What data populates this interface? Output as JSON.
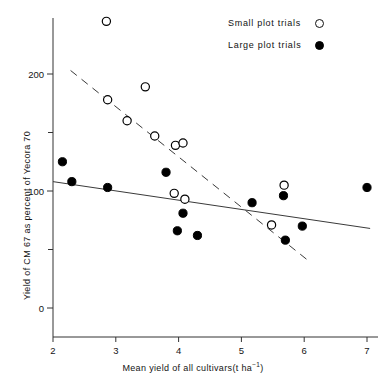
{
  "chart_data": {
    "type": "scatter",
    "title": "",
    "xlabel": "Mean yield of all cultivars (t ha⁻¹)",
    "ylabel": "Yield of CM 67 as percent of Yecora 70",
    "xlim": [
      2,
      7
    ],
    "ylim": [
      0,
      260
    ],
    "grid": false,
    "legend_position": "top-right",
    "xticks": [
      2,
      3,
      4,
      5,
      6,
      7
    ],
    "xtick_labels": [
      "2",
      "3",
      "4",
      "5",
      "6",
      "7"
    ],
    "yticks": [
      0,
      50,
      100,
      150,
      200
    ],
    "ytick_labels": [
      "0",
      "",
      "100",
      "",
      "200"
    ],
    "ytick_labeled": [
      0,
      100,
      200
    ],
    "series": [
      {
        "name": "Small plot trials",
        "marker": "open-circle",
        "color": "#000000",
        "points": [
          {
            "x": 2.85,
            "y": 245
          },
          {
            "x": 2.87,
            "y": 178
          },
          {
            "x": 3.47,
            "y": 189
          },
          {
            "x": 3.18,
            "y": 160
          },
          {
            "x": 3.62,
            "y": 147
          },
          {
            "x": 3.95,
            "y": 139
          },
          {
            "x": 4.07,
            "y": 141
          },
          {
            "x": 3.93,
            "y": 98
          },
          {
            "x": 4.1,
            "y": 93
          },
          {
            "x": 5.48,
            "y": 71
          },
          {
            "x": 5.68,
            "y": 105
          }
        ]
      },
      {
        "name": "Large plot trials",
        "marker": "filled-circle",
        "color": "#000000",
        "points": [
          {
            "x": 2.15,
            "y": 125
          },
          {
            "x": 2.3,
            "y": 108
          },
          {
            "x": 2.87,
            "y": 103
          },
          {
            "x": 3.8,
            "y": 116
          },
          {
            "x": 4.07,
            "y": 81
          },
          {
            "x": 3.98,
            "y": 66
          },
          {
            "x": 4.3,
            "y": 62
          },
          {
            "x": 5.17,
            "y": 90
          },
          {
            "x": 5.67,
            "y": 96
          },
          {
            "x": 5.7,
            "y": 58
          },
          {
            "x": 5.97,
            "y": 70
          },
          {
            "x": 7.0,
            "y": 103
          }
        ]
      }
    ],
    "trend_lines": [
      {
        "name": "small-plot-trend",
        "style": "dashed",
        "x1": 2.28,
        "y1": 203,
        "x2": 6.1,
        "y2": 39
      },
      {
        "name": "large-plot-trend",
        "style": "solid",
        "x1": 2.0,
        "y1": 108,
        "x2": 7.05,
        "y2": 68
      }
    ]
  },
  "legend": {
    "items": [
      {
        "label": "Small plot  trials",
        "marker": "open"
      },
      {
        "label": "Large plot  trials",
        "marker": "filled"
      }
    ]
  },
  "axes": {
    "x_title": "Mean yield of all cultivars",
    "x_units_pre": "(t ha",
    "x_units_sup": "−1",
    "x_units_post": ")",
    "y_title": "Yield of CM 67 as percent of Yecora 70"
  }
}
